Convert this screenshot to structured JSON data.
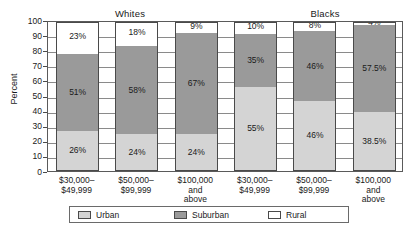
{
  "chart_data": {
    "type": "bar",
    "subtype": "stacked-bar-100",
    "title": "",
    "xlabel": "",
    "ylabel": "Percent",
    "ylim": [
      0,
      100
    ],
    "ytick_labels": [
      "100",
      "90",
      "80",
      "70",
      "60",
      "50",
      "40",
      "30",
      "20",
      "10",
      "0"
    ],
    "ytick_values": [
      100,
      90,
      80,
      70,
      60,
      50,
      40,
      30,
      20,
      10,
      0
    ],
    "grid": true,
    "legend_position": "bottom",
    "groups": [
      {
        "name": "Whites",
        "categories": [
          "$30,000–\n$49,999",
          "$50,000–\n$99,999",
          "$100,000\nand\nabove"
        ],
        "bars": [
          {
            "category": "$30,000–\n$49,999",
            "segments": [
              {
                "series": "Urban",
                "value": 26,
                "label": "26%"
              },
              {
                "series": "Suburban",
                "value": 51,
                "label": "51%"
              },
              {
                "series": "Rural",
                "value": 23,
                "label": "23%"
              }
            ]
          },
          {
            "category": "$50,000–\n$99,999",
            "segments": [
              {
                "series": "Urban",
                "value": 24,
                "label": "24%"
              },
              {
                "series": "Suburban",
                "value": 58,
                "label": "58%"
              },
              {
                "series": "Rural",
                "value": 18,
                "label": "18%"
              }
            ]
          },
          {
            "category": "$100,000\nand\nabove",
            "segments": [
              {
                "series": "Urban",
                "value": 24,
                "label": "24%"
              },
              {
                "series": "Suburban",
                "value": 67,
                "label": "67%"
              },
              {
                "series": "Rural",
                "value": 9,
                "label": "9%"
              }
            ]
          }
        ]
      },
      {
        "name": "Blacks",
        "categories": [
          "$30,000–\n$49,999",
          "$50,000–\n$99,999",
          "$100,000\nand\nabove"
        ],
        "bars": [
          {
            "category": "$30,000–\n$49,999",
            "segments": [
              {
                "series": "Urban",
                "value": 55,
                "label": "55%"
              },
              {
                "series": "Suburban",
                "value": 35,
                "label": "35%"
              },
              {
                "series": "Rural",
                "value": 10,
                "label": "10%"
              }
            ]
          },
          {
            "category": "$50,000–\n$99,999",
            "segments": [
              {
                "series": "Urban",
                "value": 46,
                "label": "46%"
              },
              {
                "series": "Suburban",
                "value": 46,
                "label": "46%"
              },
              {
                "series": "Rural",
                "value": 8,
                "label": "8%"
              }
            ]
          },
          {
            "category": "$100,000\nand\nabove",
            "segments": [
              {
                "series": "Urban",
                "value": 38.5,
                "label": "38.5%"
              },
              {
                "series": "Suburban",
                "value": 57.5,
                "label": "57.5%"
              },
              {
                "series": "Rural",
                "value": 4,
                "label": "4%"
              }
            ]
          }
        ]
      }
    ],
    "legend": [
      {
        "label": "Urban",
        "color": "#d4d4d4",
        "key": "urban"
      },
      {
        "label": "Suburban",
        "color": "#9a9a9a",
        "key": "suburban"
      },
      {
        "label": "Rural",
        "color": "#ffffff",
        "key": "rural"
      }
    ],
    "colors": {
      "urban": "#d4d4d4",
      "suburban": "#9a9a9a",
      "rural": "#ffffff",
      "axis": "#4a4a4a",
      "grid": "#8a8a8a",
      "text": "#1a1a1a",
      "background": "#ffffff"
    }
  }
}
